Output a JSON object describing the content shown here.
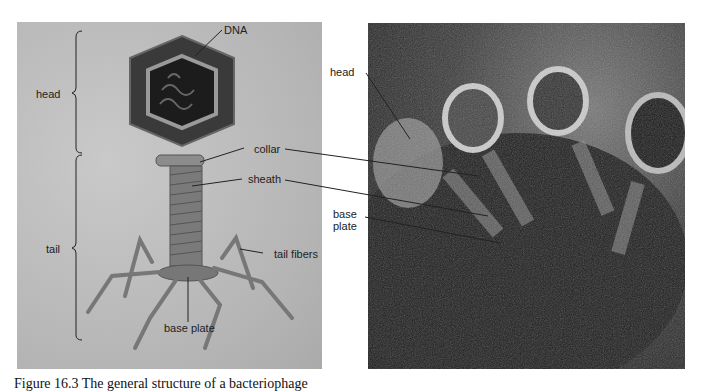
{
  "diagram": {
    "left_panel": {
      "labels": {
        "dna": "DNA",
        "head": "head",
        "tail": "tail",
        "collar": "collar",
        "sheath": "sheath",
        "tail_fibers": "tail fibers",
        "base_plate": "base plate"
      }
    },
    "right_panel": {
      "labels": {
        "head": "head",
        "base_plate_line1": "base",
        "base_plate_line2": "plate"
      }
    },
    "caption": "Figure 16.3 The general structure of a bacteriophage"
  }
}
